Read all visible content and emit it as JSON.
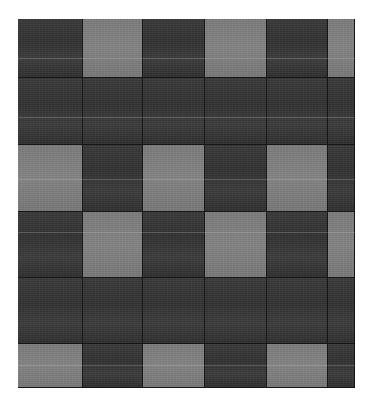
{
  "image": {
    "subject": "Gray checkered patchwork fabric / quilt",
    "colors": {
      "dark": "#363636",
      "light": "#808080",
      "background": "#ffffff"
    }
  },
  "grid": {
    "col_edges": [
      0,
      65,
      125,
      187,
      249,
      310,
      337
    ],
    "row_edges": [
      0,
      59,
      126,
      193,
      259,
      325,
      369
    ],
    "pattern": [
      [
        "dark",
        "light",
        "dark",
        "light",
        "dark",
        "light"
      ],
      [
        "dark",
        "dark",
        "dark",
        "dark",
        "dark",
        "dark"
      ],
      [
        "light",
        "dark",
        "light",
        "dark",
        "light",
        "dark"
      ],
      [
        "dark",
        "light",
        "dark",
        "light",
        "dark",
        "light"
      ],
      [
        "dark",
        "dark",
        "dark",
        "dark",
        "dark",
        "dark"
      ],
      [
        "light",
        "dark",
        "light",
        "dark",
        "light",
        "dark"
      ]
    ]
  }
}
